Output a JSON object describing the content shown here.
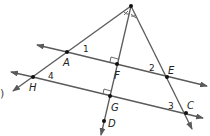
{
  "diagram": {
    "colors": {
      "line": "#5a5a5a",
      "point": "#111111",
      "text": "#222222",
      "background": "#ffffff"
    },
    "points": {
      "vertex": {
        "label": "",
        "x": 131,
        "y": 6
      },
      "A": {
        "label": "A",
        "x": 67,
        "y": 52
      },
      "F": {
        "label": "F",
        "x": 117,
        "y": 64
      },
      "E": {
        "label": "E",
        "x": 167,
        "y": 77
      },
      "H": {
        "label": "H",
        "x": 33,
        "y": 77
      },
      "G": {
        "label": "G",
        "x": 110,
        "y": 96
      },
      "C": {
        "label": "C",
        "x": 186,
        "y": 113
      },
      "D": {
        "label": "D",
        "x": 104,
        "y": 121
      }
    },
    "angle_labels": {
      "a1": "1",
      "a2": "2",
      "a3": "3",
      "a4": "4"
    },
    "edge_fragment": ")",
    "notes": {
      "right_angle_marks": [
        "at F",
        "at G"
      ],
      "congruent_angle_marks": "at top vertex"
    }
  }
}
